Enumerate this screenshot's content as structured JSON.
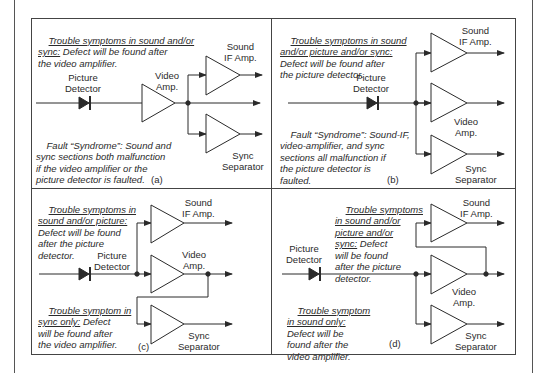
{
  "panels": {
    "a": {
      "caption": "(a)",
      "trouble_title_1": "Trouble symptoms in sound and/or",
      "trouble_title_2": "sync:",
      "trouble_rest_2": " Defect will be found after",
      "trouble_rest_3": "the video amplifier.",
      "labels": {
        "picture_detector": "Picture\nDetector",
        "video_amp": "Video\nAmp.",
        "sound_if": "Sound\nIF Amp.",
        "sync_sep": "Sync\nSeparator"
      },
      "fault_1": "Fault “Syndrome”: Sound and",
      "fault_2": "sync sections both malfunction",
      "fault_3": "if the video amplifier or the",
      "fault_4": "picture detector is faulted."
    },
    "b": {
      "caption": "(b)",
      "trouble_1": "Trouble symptoms in sound",
      "trouble_2": "and/or picture and/or sync:",
      "trouble_3": "Defect will be found after",
      "trouble_4": "the picture detector.",
      "labels": {
        "picture_detector": "Picture\nDetector",
        "video_amp": "Video\nAmp.",
        "sound_if": "Sound\nIF Amp.",
        "sync_sep": "Sync\nSeparator"
      },
      "fault_1": "Fault “Syndrome”: Sound-IF,",
      "fault_2": "video-amplifier, and sync",
      "fault_3": "sections all malfunction if",
      "fault_4": "the picture detector is",
      "fault_5": "faulted."
    },
    "c": {
      "caption": "(c)",
      "trouble_1": "Trouble symptoms in",
      "trouble_2": "sound and/or picture:",
      "trouble_3": "Defect will be found",
      "trouble_4": "after the picture",
      "trouble_5": "detector.",
      "labels": {
        "picture_detector": "Picture\nDetector",
        "video_amp": "Video\nAmp.",
        "sound_if": "Sound\nIF Amp.",
        "sync_sep": "Sync\nSeparator"
      },
      "sync_1": "Trouble symptom in",
      "sync_2": "sync only:",
      "sync_2b": " Defect",
      "sync_3": "will be found after",
      "sync_4": "the video amplifier."
    },
    "d": {
      "caption": "(d)",
      "trouble_1": "Trouble symptoms",
      "trouble_2": "in sound and/or",
      "trouble_3": "picture and/or",
      "trouble_4": "sync:",
      "trouble_4b": " Defect",
      "trouble_5": "will be found",
      "trouble_6": "after the picture",
      "trouble_7": "detector.",
      "labels": {
        "picture_detector": "Picture\nDetector",
        "video_amp": "Video\nAmp.",
        "sound_if": "Sound\nIF Amp.",
        "sync_sep": "Sync\nSeparator"
      },
      "sound_1": "Trouble symptom",
      "sound_2": "in sound only:",
      "sound_3": "Defect will be",
      "sound_4": "found after the",
      "sound_5": "video amplifier."
    }
  },
  "colors": {
    "line": "#2a2a2a",
    "frame": "#444444",
    "background": "#ffffff"
  }
}
